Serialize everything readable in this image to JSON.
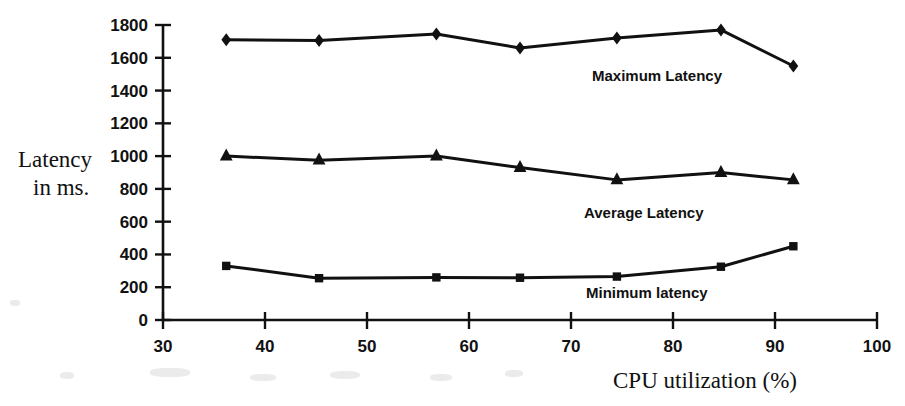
{
  "chart_data": {
    "type": "line",
    "title": "",
    "xlabel": "CPU utilization (%)",
    "ylabel": "Latency in ms.",
    "ylabel_line1": "Latency",
    "ylabel_line2": "in ms.",
    "xlim": [
      30,
      100
    ],
    "ylim": [
      0,
      1800
    ],
    "xticks": [
      30,
      40,
      50,
      60,
      70,
      80,
      90,
      100
    ],
    "yticks": [
      0,
      200,
      400,
      600,
      800,
      1000,
      1200,
      1400,
      1600,
      1800
    ],
    "xtick_labels": [
      "30",
      "40",
      "50",
      "60",
      "70",
      "80",
      "90",
      "100"
    ],
    "ytick_labels": [
      "0",
      "200",
      "400",
      "600",
      "800",
      "1000",
      "1200",
      "1400",
      "1600",
      "1800"
    ],
    "grid": false,
    "legend": "inline-annotations",
    "x": [
      36.2,
      45.3,
      56.8,
      65.0,
      74.5,
      84.7,
      91.8
    ],
    "series": [
      {
        "name": "Maximum Latency",
        "marker": "diamond",
        "values": [
          1710,
          1705,
          1745,
          1660,
          1720,
          1770,
          1550
        ],
        "annotation": "Maximum Latency"
      },
      {
        "name": "Average Latency",
        "marker": "triangle",
        "values": [
          1000,
          975,
          1000,
          930,
          855,
          900,
          855
        ],
        "annotation": "Average Latency"
      },
      {
        "name": "Minimum latency",
        "marker": "square",
        "values": [
          330,
          255,
          260,
          258,
          265,
          325,
          450
        ],
        "annotation": "Minimum latency"
      }
    ],
    "annotations": [
      {
        "text": "Maximum Latency",
        "x_px": 592,
        "y_px": 76
      },
      {
        "text": "Average Latency",
        "x_px": 584,
        "y_px": 213
      },
      {
        "text": "Minimum latency",
        "x_px": 586,
        "y_px": 293
      },
      {
        "text": "CPU utilization (%)",
        "x_px": 613,
        "y_px": 380
      },
      {
        "text": "Latency",
        "x_px": 18,
        "y_px": 160
      },
      {
        "text": "in ms.",
        "x_px": 33,
        "y_px": 186
      }
    ],
    "colors": {
      "line": "#111111",
      "marker": "#111111",
      "axis": "#111111",
      "background": "#ffffff"
    }
  }
}
